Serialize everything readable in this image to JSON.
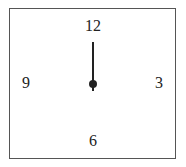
{
  "clock": {
    "numerals": {
      "twelve": "12",
      "three": "3",
      "six": "6",
      "nine": "9"
    },
    "hands": [
      {
        "name": "hand",
        "points_to": "12"
      }
    ],
    "colors": {
      "border": "#555555",
      "ink": "#222222",
      "background": "#ffffff"
    }
  }
}
